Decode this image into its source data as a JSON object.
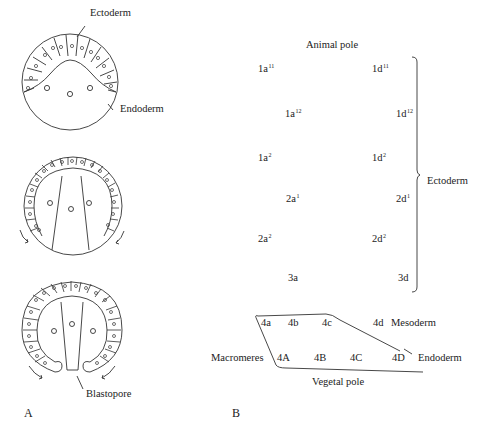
{
  "panel_a": {
    "label": "A",
    "stage1": {
      "ectoderm_label": "Ectoderm",
      "endoderm_label": "Endoderm"
    },
    "stage3": {
      "blastopore_label": "Blastopore"
    }
  },
  "panel_b": {
    "label": "B",
    "animal_pole": "Animal pole",
    "vegetal_pole": "Vegetal pole",
    "ectoderm_label": "Ectoderm",
    "mesoderm_label": "Mesoderm",
    "endoderm_label": "Endoderm",
    "macromeres_label": "Macromeres",
    "cells": {
      "c1a11": {
        "base": "1a",
        "sup": "11"
      },
      "c1d11": {
        "base": "1d",
        "sup": "11"
      },
      "c1a12": {
        "base": "1a",
        "sup": "12"
      },
      "c1d12": {
        "base": "1d",
        "sup": "12"
      },
      "c1a2": {
        "base": "1a",
        "sup": "2"
      },
      "c1d2": {
        "base": "1d",
        "sup": "2"
      },
      "c2a1": {
        "base": "2a",
        "sup": "1"
      },
      "c2d1": {
        "base": "2d",
        "sup": "1"
      },
      "c2a2": {
        "base": "2a",
        "sup": "2"
      },
      "c2d2": {
        "base": "2d",
        "sup": "2"
      },
      "c3a": "3a",
      "c3d": "3d",
      "c4a": "4a",
      "c4b": "4b",
      "c4c": "4c",
      "c4d": "4d",
      "c4A": "4A",
      "c4B": "4B",
      "c4C": "4C",
      "c4D": "4D"
    }
  }
}
